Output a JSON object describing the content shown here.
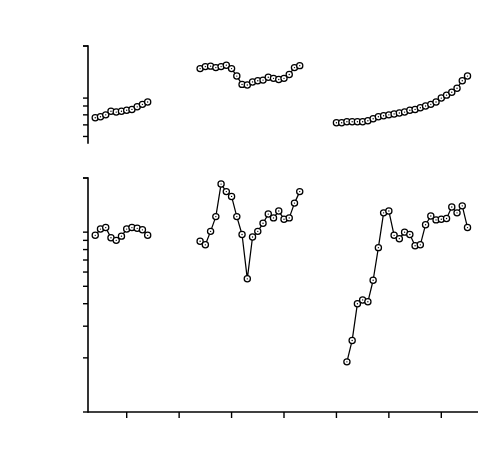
{
  "figure": {
    "title": "",
    "background": "#ffffff",
    "ink": "#000000",
    "marker_fill": "#ffffff"
  },
  "axis": {
    "x_label": "",
    "x_ticks": [
      1910,
      1920,
      1930,
      1940,
      1950,
      1960,
      1970
    ],
    "x_tick_labels": [
      "1910",
      "1920",
      "1930",
      "1940",
      "1950",
      "1960",
      "1970"
    ],
    "x_min": 1903,
    "x_max": 1977
  },
  "rows": [
    {
      "name": "consumer-prices",
      "row_label_line1": "Consumer Prices",
      "row_label_line2": "Index 1913-1914 = 100",
      "panel_symbol": "P",
      "panel_symbol_sub": "",
      "y_ticks": [
        60,
        70,
        80,
        90,
        100,
        200
      ],
      "y_tick_labels": [
        "60",
        "70",
        "80",
        "90",
        "100",
        "200"
      ],
      "y_min": 55,
      "y_max": 200,
      "scale": "log"
    },
    {
      "name": "share-prices",
      "row_label_line1": "Share Prices",
      "row_label_line2": "Index 1913 = 100",
      "panel_symbol": "Π",
      "panel_symbol_sub": "s",
      "y_ticks": [
        10,
        20,
        30,
        40,
        50,
        60,
        70,
        80,
        90,
        100,
        200
      ],
      "y_tick_labels": [
        "10",
        "20",
        "30",
        "40",
        "50",
        "60",
        "70",
        "80",
        "90",
        "100",
        "200"
      ],
      "y_min": 10,
      "y_max": 200,
      "scale": "log"
    }
  ],
  "chart_data": {
    "type": "line",
    "title": "",
    "xlabel": "",
    "ylabel": "Index",
    "layout": "2 rows x 3 column-segments sharing one time axis (1903-1977); log y-scales; open circle markers connected by lines; no gridlines; no legend",
    "panels": [
      {
        "id": "p1",
        "row": "consumer-prices",
        "segment": 1,
        "ylabel": "Index 1913-1914 = 100",
        "annotation": "P",
        "ylim": [
          55,
          200
        ],
        "yscale": "log",
        "yticks": [
          60,
          70,
          80,
          90,
          100,
          200
        ],
        "xlim": [
          1903,
          1977
        ],
        "x": [
          1904,
          1905,
          1906,
          1907,
          1908,
          1909,
          1910,
          1911,
          1912,
          1913,
          1914
        ],
        "y": [
          77,
          78,
          80,
          84,
          83,
          84,
          85,
          86,
          89,
          92,
          95
        ]
      },
      {
        "id": "p2",
        "row": "consumer-prices",
        "segment": 2,
        "ylabel": "Index 1913-1914 = 100",
        "ylim": [
          55,
          200
        ],
        "yscale": "log",
        "xlim": [
          1903,
          1977
        ],
        "x": [
          1924,
          1925,
          1926,
          1927,
          1928,
          1929,
          1930,
          1931,
          1932,
          1933,
          1934,
          1935,
          1936,
          1937,
          1938,
          1939,
          1940,
          1941,
          1942,
          1943
        ],
        "y": [
          148,
          152,
          153,
          150,
          152,
          155,
          148,
          134,
          120,
          119,
          124,
          126,
          127,
          132,
          130,
          128,
          130,
          137,
          150,
          154
        ]
      },
      {
        "id": "p3",
        "row": "consumer-prices",
        "segment": 3,
        "ylabel": "Index 1970 = 100",
        "ylim": [
          55,
          200
        ],
        "yscale": "log",
        "xlim": [
          1903,
          1977
        ],
        "x": [
          1950,
          1951,
          1952,
          1953,
          1954,
          1955,
          1956,
          1957,
          1958,
          1959,
          1960,
          1961,
          1962,
          1963,
          1964,
          1965,
          1966,
          1967,
          1968,
          1969,
          1970,
          1971,
          1972,
          1973,
          1974,
          1975
        ],
        "y": [
          72,
          72,
          73,
          73,
          73,
          73,
          74,
          76,
          78,
          79,
          80,
          81,
          82,
          83,
          85,
          86,
          88,
          90,
          92,
          95,
          100,
          104,
          108,
          114,
          126,
          134
        ]
      },
      {
        "id": "p4",
        "row": "share-prices",
        "segment": 1,
        "ylabel": "Index 1913 = 100",
        "annotation": "Πs",
        "ylim": [
          10,
          200
        ],
        "yscale": "log",
        "yticks": [
          10,
          20,
          30,
          40,
          50,
          60,
          70,
          80,
          90,
          100,
          200
        ],
        "xlim": [
          1903,
          1977
        ],
        "x": [
          1904,
          1905,
          1906,
          1907,
          1908,
          1909,
          1910,
          1911,
          1912,
          1913,
          1914
        ],
        "y": [
          96,
          104,
          106,
          93,
          90,
          95,
          104,
          106,
          105,
          103,
          96
        ]
      },
      {
        "id": "p5",
        "row": "share-prices",
        "segment": 2,
        "ylabel": "Index 1924-1926 = 100",
        "ylim": [
          10,
          200
        ],
        "yscale": "log",
        "xlim": [
          1903,
          1977
        ],
        "x": [
          1924,
          1925,
          1926,
          1927,
          1928,
          1929,
          1930,
          1931,
          1932,
          1933,
          1934,
          1935,
          1936,
          1937,
          1938,
          1939,
          1940,
          1941,
          1942,
          1943
        ],
        "y": [
          89,
          85,
          101,
          122,
          185,
          168,
          158,
          122,
          97,
          55,
          94,
          101,
          112,
          126,
          120,
          131,
          118,
          120,
          145,
          168,
          178
        ]
      },
      {
        "id": "p6",
        "row": "share-prices",
        "segment": 3,
        "ylabel": "Index Dec. 31, 1965 = 100",
        "ylim": [
          10,
          200
        ],
        "yscale": "log",
        "xlim": [
          1903,
          1977
        ],
        "x": [
          1952,
          1953,
          1954,
          1955,
          1956,
          1957,
          1958,
          1959,
          1960,
          1961,
          1962,
          1963,
          1964,
          1965,
          1966,
          1967,
          1968,
          1969,
          1970,
          1971,
          1972,
          1973,
          1974,
          1975
        ],
        "y": [
          19,
          25,
          40,
          42,
          41,
          54,
          82,
          128,
          131,
          96,
          92,
          100,
          97,
          84,
          85,
          110,
          123,
          117,
          118,
          119,
          138,
          128,
          140,
          106
        ]
      }
    ]
  }
}
